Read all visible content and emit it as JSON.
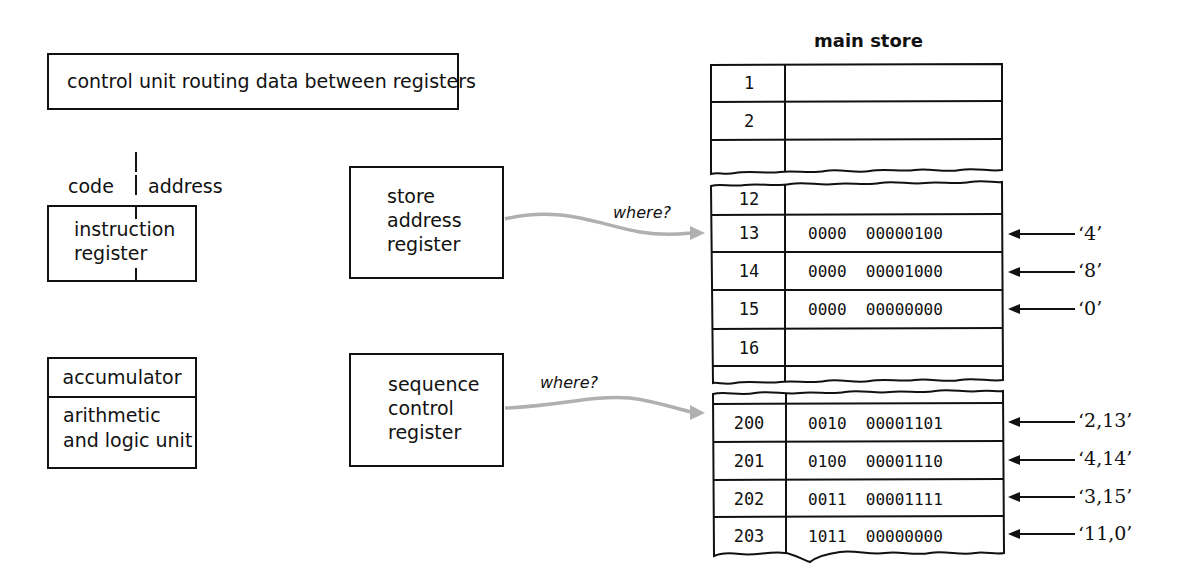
{
  "control_unit": {
    "label": "control unit routing data between registers"
  },
  "instruction_register": {
    "code_label": "code",
    "address_label": "address",
    "label_line1": "instruction",
    "label_line2": "register"
  },
  "accumulator": {
    "label": "accumulator",
    "alu_line1": "arithmetic",
    "alu_line2": "and logic unit"
  },
  "store_address_register": {
    "line1": "store",
    "line2": "address",
    "line3": "register",
    "arrow_label": "where?"
  },
  "sequence_control_register": {
    "line1": "sequence",
    "line2": "control",
    "line3": "register",
    "arrow_label": "where?"
  },
  "main_store": {
    "title": "main store",
    "block1": [
      {
        "address": "1",
        "value": ""
      },
      {
        "address": "2",
        "value": ""
      },
      {
        "address": "",
        "value": ""
      }
    ],
    "block2": [
      {
        "address": "12",
        "value": "",
        "annotation": ""
      },
      {
        "address": "13",
        "value": "0000  00000100",
        "annotation": "‘4’"
      },
      {
        "address": "14",
        "value": "0000  00001000",
        "annotation": "‘8’"
      },
      {
        "address": "15",
        "value": "0000  00000000",
        "annotation": "‘0’"
      },
      {
        "address": "16",
        "value": "",
        "annotation": ""
      }
    ],
    "block3": [
      {
        "address": "200",
        "value": "0010  00001101",
        "annotation": "‘2,13’"
      },
      {
        "address": "201",
        "value": "0100  00001110",
        "annotation": "‘4,14’"
      },
      {
        "address": "202",
        "value": "0011  00001111",
        "annotation": "‘3,15’"
      },
      {
        "address": "203",
        "value": "1011  00000000",
        "annotation": "‘11,0’"
      }
    ]
  },
  "colors": {
    "ink": "#111111",
    "arrow_grey": "#b0b0b0",
    "background": "#ffffff"
  }
}
